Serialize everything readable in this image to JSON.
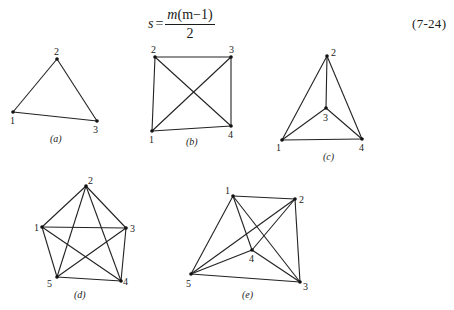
{
  "equation": {
    "lhs": "s",
    "equals": "=",
    "numerator_prefix": "m",
    "numerator_inner": "(m−1)",
    "denominator": "2",
    "number": "(7-24)"
  },
  "figures": [
    {
      "id": "a",
      "caption": "(a)",
      "caption_pos": [
        50,
        142
      ],
      "vertices": [
        {
          "label": "1",
          "x": 13,
          "y": 112,
          "lx": 10,
          "ly": 124
        },
        {
          "label": "2",
          "x": 57,
          "y": 59,
          "lx": 54,
          "ly": 55
        },
        {
          "label": "3",
          "x": 97,
          "y": 121,
          "lx": 93,
          "ly": 133
        }
      ],
      "edges": [
        [
          "1",
          "2"
        ],
        [
          "2",
          "3"
        ],
        [
          "1",
          "3"
        ]
      ]
    },
    {
      "id": "b",
      "caption": "(b)",
      "caption_pos": [
        186,
        145
      ],
      "vertices": [
        {
          "label": "1",
          "x": 152,
          "y": 131,
          "lx": 149,
          "ly": 143
        },
        {
          "label": "2",
          "x": 155,
          "y": 57,
          "lx": 151,
          "ly": 53
        },
        {
          "label": "3",
          "x": 231,
          "y": 57,
          "lx": 229,
          "ly": 53
        },
        {
          "label": "4",
          "x": 231,
          "y": 126,
          "lx": 228,
          "ly": 138
        }
      ],
      "edges": [
        [
          "1",
          "2"
        ],
        [
          "2",
          "3"
        ],
        [
          "3",
          "4"
        ],
        [
          "1",
          "4"
        ],
        [
          "1",
          "3"
        ],
        [
          "2",
          "4"
        ]
      ]
    },
    {
      "id": "c",
      "caption": "(c)",
      "caption_pos": [
        323,
        160
      ],
      "vertices": [
        {
          "label": "1",
          "x": 282,
          "y": 140,
          "lx": 276,
          "ly": 151
        },
        {
          "label": "2",
          "x": 327,
          "y": 56,
          "lx": 331,
          "ly": 56
        },
        {
          "label": "3",
          "x": 326,
          "y": 108,
          "lx": 323,
          "ly": 121
        },
        {
          "label": "4",
          "x": 362,
          "y": 139,
          "lx": 359,
          "ly": 151
        }
      ],
      "edges": [
        [
          "1",
          "2"
        ],
        [
          "2",
          "4"
        ],
        [
          "1",
          "4"
        ],
        [
          "2",
          "3"
        ],
        [
          "1",
          "3"
        ],
        [
          "3",
          "4"
        ]
      ]
    },
    {
      "id": "d",
      "caption": "(d)",
      "caption_pos": [
        74,
        298
      ],
      "vertices": [
        {
          "label": "1",
          "x": 42,
          "y": 227,
          "lx": 34,
          "ly": 231
        },
        {
          "label": "2",
          "x": 86,
          "y": 186,
          "lx": 88,
          "ly": 184
        },
        {
          "label": "3",
          "x": 126,
          "y": 228,
          "lx": 130,
          "ly": 232
        },
        {
          "label": "4",
          "x": 121,
          "y": 281,
          "lx": 123,
          "ly": 285
        },
        {
          "label": "5",
          "x": 57,
          "y": 277,
          "lx": 47,
          "ly": 287
        }
      ],
      "edges": [
        [
          "1",
          "2"
        ],
        [
          "2",
          "3"
        ],
        [
          "3",
          "4"
        ],
        [
          "4",
          "5"
        ],
        [
          "5",
          "1"
        ],
        [
          "1",
          "3"
        ],
        [
          "1",
          "4"
        ],
        [
          "2",
          "4"
        ],
        [
          "2",
          "5"
        ],
        [
          "3",
          "5"
        ]
      ]
    },
    {
      "id": "e",
      "caption": "(e)",
      "caption_pos": [
        242,
        298
      ],
      "vertices": [
        {
          "label": "1",
          "x": 233,
          "y": 196,
          "lx": 225,
          "ly": 194
        },
        {
          "label": "2",
          "x": 295,
          "y": 199,
          "lx": 299,
          "ly": 203
        },
        {
          "label": "3",
          "x": 300,
          "y": 282,
          "lx": 303,
          "ly": 290
        },
        {
          "label": "4",
          "x": 252,
          "y": 250,
          "lx": 249,
          "ly": 262
        },
        {
          "label": "5",
          "x": 191,
          "y": 274,
          "lx": 186,
          "ly": 287
        }
      ],
      "edges": [
        [
          "1",
          "2"
        ],
        [
          "1",
          "5"
        ],
        [
          "1",
          "4"
        ],
        [
          "1",
          "3"
        ],
        [
          "2",
          "5"
        ],
        [
          "2",
          "4"
        ],
        [
          "2",
          "3"
        ],
        [
          "5",
          "3"
        ],
        [
          "5",
          "4"
        ],
        [
          "4",
          "3"
        ]
      ]
    }
  ]
}
